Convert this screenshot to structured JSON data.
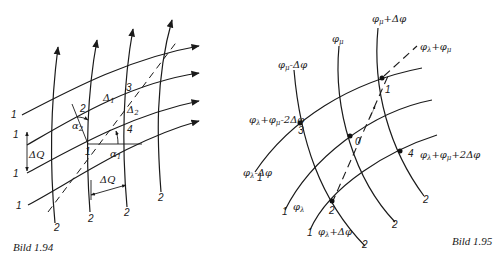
{
  "figures": [
    {
      "caption": "Bild 1.94",
      "labels": {
        "family1": "1",
        "family2": "2",
        "point1": "1",
        "point2": "2",
        "point3": "3",
        "point4": "4",
        "delta1": "Δ1",
        "delta2": "Δ2",
        "alpha1": "α1",
        "alpha2": "α2",
        "deltaQ": "ΔQ"
      }
    },
    {
      "caption": "Bild 1.95",
      "labels": {
        "phi_mu_minus": "φμ-Δφ",
        "phi_mu": "φμ",
        "phi_mu_plus": "φμ+Δφ",
        "phi_lambda_plus_mu": "φλ+φμ",
        "phi_lambda_minus": "φλ-Δφ",
        "phi_lambda": "φλ",
        "phi_lambda_plus": "φλ+Δφ",
        "sum_minus_2": "φλ+φμ-2Δφ",
        "sum_plus_2": "φλ+φμ+2Δφ",
        "point0": "0",
        "point1": "1",
        "point2": "2",
        "point3": "3",
        "point4": "4",
        "family1": "1",
        "family2": "2"
      }
    }
  ]
}
